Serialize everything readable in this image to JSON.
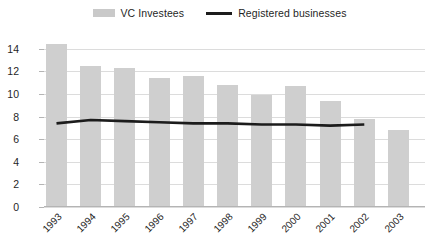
{
  "legend": {
    "entries": [
      {
        "label": "VC Investees",
        "marker": "bar-swatch-icon",
        "color": "#cfcfcf"
      },
      {
        "label": "Registered businesses",
        "marker": "line-swatch-icon",
        "color": "#1c1c1c"
      }
    ]
  },
  "axes": {
    "y_ticks": [
      "0",
      "2",
      "4",
      "6",
      "8",
      "10",
      "12",
      "14"
    ],
    "x_ticks": [
      "1993",
      "1994",
      "1995",
      "1996",
      "1997",
      "1998",
      "1999",
      "2000",
      "2001",
      "2002",
      "2003"
    ]
  },
  "chart_data": {
    "type": "bar",
    "title": "",
    "xlabel": "",
    "ylabel": "",
    "ylim": [
      0,
      14.6
    ],
    "ytick_step": 2,
    "grid": true,
    "legend_position": "top-center",
    "categories": [
      "1993",
      "1994",
      "1995",
      "1996",
      "1997",
      "1998",
      "1999",
      "2000",
      "2001",
      "2002",
      "2003"
    ],
    "series": [
      {
        "name": "VC Investees",
        "type": "bar",
        "color": "#cfcfcf",
        "values": [
          14.4,
          12.5,
          12.3,
          11.4,
          11.6,
          10.8,
          9.9,
          10.7,
          9.4,
          7.8,
          6.8
        ]
      },
      {
        "name": "Registered businesses",
        "type": "line",
        "color": "#1c1c1c",
        "values": [
          7.4,
          7.7,
          7.6,
          7.5,
          7.4,
          7.4,
          7.3,
          7.3,
          7.2,
          7.3,
          null
        ]
      }
    ]
  }
}
